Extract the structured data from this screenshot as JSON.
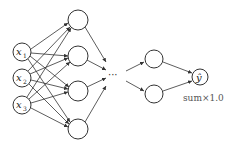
{
  "diagram": {
    "title": "",
    "type": "feedforward-neural-network",
    "colors": {
      "stroke": "#333333",
      "fill": "#ffffff",
      "text": "#222222",
      "note": "#555555"
    },
    "input_layer": {
      "nodes": [
        {
          "label": "x",
          "subscript": "1"
        },
        {
          "label": "x",
          "subscript": "2"
        },
        {
          "label": "x",
          "subscript": "3"
        }
      ]
    },
    "hidden_layer_1": {
      "node_count": 4
    },
    "ellipsis": "···",
    "hidden_layer_last": {
      "node_count": 2
    },
    "output_layer": {
      "nodes": [
        {
          "label": "ŷ"
        }
      ],
      "annotation": "sum×1.0"
    }
  }
}
